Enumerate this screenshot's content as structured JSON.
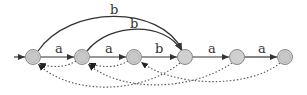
{
  "diagram": {
    "type": "automaton",
    "states": [
      {
        "id": 0,
        "x": 33,
        "y": 57,
        "initial": true,
        "accepting": false
      },
      {
        "id": 1,
        "x": 82,
        "y": 57,
        "initial": false,
        "accepting": false
      },
      {
        "id": 2,
        "x": 134,
        "y": 57,
        "initial": false,
        "accepting": false
      },
      {
        "id": 3,
        "x": 185,
        "y": 57,
        "initial": false,
        "accepting": false
      },
      {
        "id": 4,
        "x": 237,
        "y": 57,
        "initial": false,
        "accepting": false
      },
      {
        "id": 5,
        "x": 285,
        "y": 57,
        "initial": false,
        "accepting": true
      }
    ],
    "edges": [
      {
        "from": 0,
        "to": 1,
        "label": "a",
        "style": "solid"
      },
      {
        "from": 1,
        "to": 2,
        "label": "a",
        "style": "solid"
      },
      {
        "from": 2,
        "to": 3,
        "label": "b",
        "style": "solid"
      },
      {
        "from": 3,
        "to": 4,
        "label": "a",
        "style": "solid"
      },
      {
        "from": 4,
        "to": 5,
        "label": "a",
        "style": "solid"
      },
      {
        "from": 0,
        "to": 3,
        "label": "b",
        "style": "solid-arc"
      },
      {
        "from": 1,
        "to": 3,
        "label": "b",
        "style": "solid-arc"
      },
      {
        "from": 1,
        "to": 0,
        "label": "",
        "style": "dotted"
      },
      {
        "from": 2,
        "to": 1,
        "label": "",
        "style": "dotted"
      },
      {
        "from": 3,
        "to": 0,
        "label": "",
        "style": "dotted"
      },
      {
        "from": 4,
        "to": 1,
        "label": "",
        "style": "dotted"
      },
      {
        "from": 5,
        "to": 2,
        "label": "",
        "style": "dotted"
      }
    ],
    "labels": {
      "e01": "a",
      "e12": "a",
      "e23": "b",
      "e34": "a",
      "e45": "a",
      "arc03": "b",
      "arc13": "b"
    },
    "colors": {
      "node_fill": "#cfcfcf",
      "node_stroke": "#888888",
      "edge": "#333333",
      "dotted": "#555555"
    }
  }
}
